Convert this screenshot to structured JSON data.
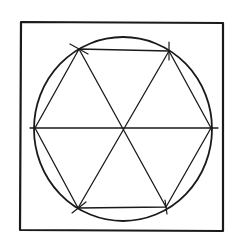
{
  "diagram": {
    "type": "geometric-construction",
    "stroke_color": "#1a1a1a",
    "background_color": "#ffffff",
    "frame": {
      "x1": 21,
      "y1": 22,
      "x2": 223,
      "y2": 231
    },
    "circle": {
      "cx": 123,
      "cy": 129,
      "rx": 89,
      "ry": 92
    },
    "center": {
      "x": 123,
      "y": 128
    },
    "vertices": [
      {
        "name": "top-left",
        "x": 79,
        "y": 49
      },
      {
        "name": "top-right",
        "x": 169,
        "y": 51
      },
      {
        "name": "right",
        "x": 211,
        "y": 128
      },
      {
        "name": "bottom-right",
        "x": 166,
        "y": 207
      },
      {
        "name": "bottom-left",
        "x": 78,
        "y": 208
      },
      {
        "name": "left",
        "x": 35,
        "y": 128
      }
    ],
    "horizontal_diameter": {
      "x1": 30,
      "x2": 218,
      "y": 128
    }
  }
}
